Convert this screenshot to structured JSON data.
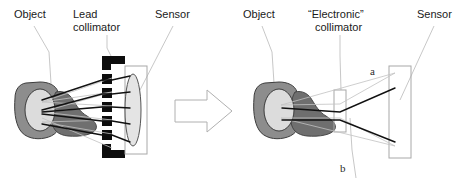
{
  "figure": {
    "width": 461,
    "height": 184,
    "background": "#ffffff",
    "type": "schematic-diagram"
  },
  "colors": {
    "lead_block": "#0d0d0d",
    "organ_body": "#8d8d8d",
    "organ_lobe": "#6f6f6f",
    "organ_core": "#dcdcdc",
    "sensor_fill": "#e4e4e4",
    "ray_dark": "#111111",
    "ray_light": "#c2c2c2",
    "leader_line": "#b9b9b9",
    "outline": "#a8a8a8",
    "text": "#1a1a1a"
  },
  "left_panel": {
    "name": "lead-collimator-panel",
    "labels": {
      "object": "Object",
      "collimator_line1": "Lead",
      "collimator_line2": "collimator",
      "sensor": "Sensor"
    },
    "lead_block_count": 7,
    "ray_count": 5
  },
  "transition": {
    "name": "transition-arrow",
    "glyph": "right-arrow",
    "style": "hollow-outline"
  },
  "right_panel": {
    "name": "electronic-collimator-panel",
    "labels": {
      "object": "Object",
      "collimator_line1": "“Electronic”",
      "collimator_line2": "collimator",
      "sensor": "Sensor",
      "ray_a": "a",
      "ray_b": "b"
    },
    "ray_count": 2
  }
}
